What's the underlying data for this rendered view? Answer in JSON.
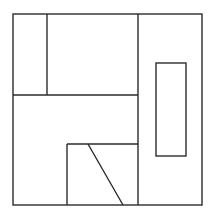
{
  "diagram": {
    "type": "floor-plan-like line drawing",
    "stroke_color": "#2b2b2b",
    "background": "#ffffff",
    "outer_frame": {
      "x": 13,
      "y": 14,
      "width": 189,
      "height": 191
    },
    "lines": [
      {
        "name": "vertical-divider-main",
        "x1": 138,
        "y1": 14,
        "x2": 138,
        "y2": 205
      },
      {
        "name": "vertical-divider-topleft",
        "x1": 47,
        "y1": 14,
        "x2": 47,
        "y2": 95
      },
      {
        "name": "horizontal-divider-middle",
        "x1": 13,
        "y1": 95,
        "x2": 138,
        "y2": 95
      },
      {
        "name": "bottom-box-top",
        "x1": 67,
        "y1": 144,
        "x2": 138,
        "y2": 144
      },
      {
        "name": "bottom-box-left",
        "x1": 67,
        "y1": 144,
        "x2": 67,
        "y2": 205
      },
      {
        "name": "diagonal-line",
        "x1": 88,
        "y1": 144,
        "x2": 123,
        "y2": 205
      }
    ],
    "inner_rect": {
      "x": 156,
      "y": 63,
      "width": 30,
      "height": 93
    }
  }
}
